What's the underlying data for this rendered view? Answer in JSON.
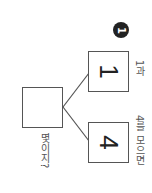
{
  "problem": {
    "number": "1",
    "part_a": {
      "value": "1",
      "label": "1과"
    },
    "part_b": {
      "value": "4",
      "label": "4를 모으면"
    },
    "whole": {
      "value": "",
      "label": "몇이지?"
    }
  },
  "colors": {
    "line": "#555555",
    "badge": "#222222"
  }
}
